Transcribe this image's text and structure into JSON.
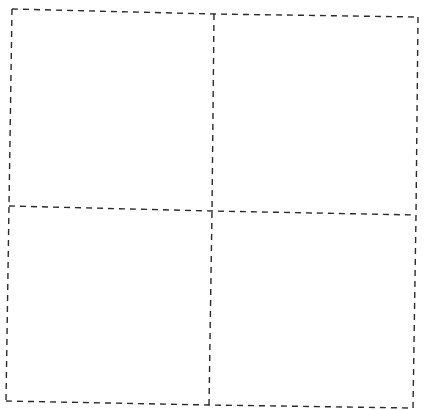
{
  "diagram": {
    "type": "grid",
    "rows": 2,
    "columns": 2,
    "line_style": "dashed",
    "line_color": "#2a2a2a",
    "background": "#ffffff",
    "points": {
      "top_left": [
        12,
        9
      ],
      "top_mid": [
        214,
        14
      ],
      "top_right": [
        418,
        17
      ],
      "mid_left": [
        9,
        206
      ],
      "center": [
        212,
        211
      ],
      "mid_right": [
        416,
        215
      ],
      "bottom_left": [
        6,
        401
      ],
      "bottom_mid": [
        209,
        405
      ],
      "bottom_right": [
        413,
        408
      ]
    },
    "cells": [
      {
        "id": "cell-top-left",
        "label": ""
      },
      {
        "id": "cell-top-right",
        "label": ""
      },
      {
        "id": "cell-bottom-left",
        "label": ""
      },
      {
        "id": "cell-bottom-right",
        "label": ""
      }
    ]
  }
}
